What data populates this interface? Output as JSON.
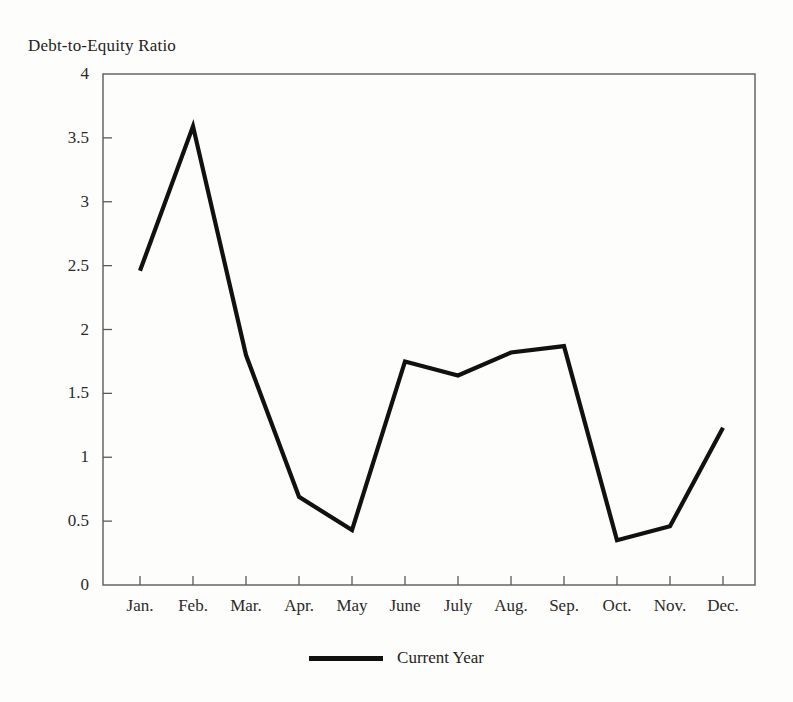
{
  "chart_data": {
    "type": "line",
    "title": "Debt-to-Equity Ratio",
    "xlabel": "",
    "ylabel": "",
    "categories": [
      "Jan.",
      "Feb.",
      "Mar.",
      "Apr.",
      "May",
      "June",
      "July",
      "Aug.",
      "Sep.",
      "Oct.",
      "Nov.",
      "Dec."
    ],
    "series": [
      {
        "name": "Current Year",
        "color": "#111111",
        "values": [
          2.46,
          3.59,
          1.8,
          0.69,
          0.43,
          1.75,
          1.64,
          1.82,
          1.87,
          0.35,
          0.46,
          1.23
        ]
      }
    ],
    "ylim": [
      0,
      4
    ],
    "yticks": [
      0,
      0.5,
      1,
      1.5,
      2,
      2.5,
      3,
      3.5,
      4
    ],
    "ytick_labels": [
      "0",
      "0.5",
      "1",
      "1.5",
      "2",
      "2.5",
      "3",
      "3.5",
      "4"
    ],
    "grid": false,
    "legend_position": "bottom",
    "frame": true,
    "tick_direction": "in"
  },
  "legend": {
    "entries": [
      {
        "label": "Current Year",
        "color": "#111111"
      }
    ]
  },
  "colors": {
    "line": "#111111",
    "axis": "#5a5a5a",
    "background": "#fdfdfb",
    "text": "#232323"
  }
}
